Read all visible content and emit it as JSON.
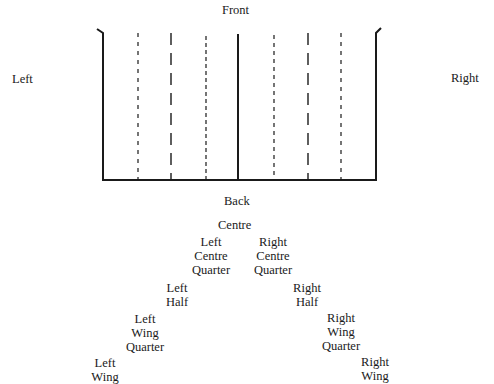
{
  "diagram": {
    "labels": {
      "front": "Front",
      "back": "Back",
      "left": "Left",
      "right": "Right"
    },
    "frame": {
      "left_x": 103,
      "right_x": 376,
      "top_y": 32,
      "bottom_y": 180,
      "center_x": 238,
      "dashed_lines": [
        {
          "x": 138,
          "style": "short"
        },
        {
          "x": 171,
          "style": "long"
        },
        {
          "x": 206,
          "style": "short"
        },
        {
          "x": 274,
          "style": "short"
        },
        {
          "x": 308,
          "style": "long"
        },
        {
          "x": 341,
          "style": "short"
        }
      ]
    },
    "positions": [
      {
        "id": "centre",
        "lines": [
          "Centre"
        ]
      },
      {
        "id": "left-centre-quarter",
        "lines": [
          "Left",
          "Centre",
          "Quarter"
        ]
      },
      {
        "id": "right-centre-quarter",
        "lines": [
          "Right",
          "Centre",
          "Quarter"
        ]
      },
      {
        "id": "left-half",
        "lines": [
          "Left",
          "Half"
        ]
      },
      {
        "id": "right-half",
        "lines": [
          "Right",
          "Half"
        ]
      },
      {
        "id": "left-wing-quarter",
        "lines": [
          "Left",
          "Wing",
          "Quarter"
        ]
      },
      {
        "id": "right-wing-quarter",
        "lines": [
          "Right",
          "Wing",
          "Quarter"
        ]
      },
      {
        "id": "left-wing",
        "lines": [
          "Left",
          "Wing"
        ]
      },
      {
        "id": "right-wing",
        "lines": [
          "Right",
          "Wing"
        ]
      }
    ]
  }
}
